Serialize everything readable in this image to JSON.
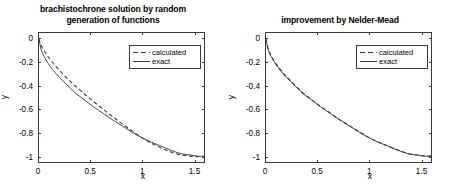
{
  "figure": {
    "width": 453,
    "height": 189,
    "background": "#ffffff",
    "line_color": "#3a3a3a",
    "axis_color": "#3a3a3a"
  },
  "panels": [
    {
      "id": "left",
      "title_line1": "brachistochrone solution by random",
      "title_line2": "generation of functions",
      "xlabel": "x",
      "ylabel": "y",
      "xticks": [
        "0",
        "0.5",
        "1",
        "1.5"
      ],
      "yticks": [
        "0",
        "-0.2",
        "-0.4",
        "-0.6",
        "-0.8",
        "-1"
      ],
      "legend": [
        {
          "label": "calculated",
          "style": "dashed"
        },
        {
          "label": "exact",
          "style": "solid"
        }
      ]
    },
    {
      "id": "right",
      "title_line1": "improvement by Nelder-Mead",
      "title_line2": "",
      "xlabel": "x",
      "ylabel": "y",
      "xticks": [
        "0",
        "0.5",
        "1",
        "1.5"
      ],
      "yticks": [
        "0",
        "-0.2",
        "-0.4",
        "-0.6",
        "-0.8",
        "-1"
      ],
      "legend": [
        {
          "label": "calculated",
          "style": "dashed"
        },
        {
          "label": "exact",
          "style": "solid"
        }
      ]
    }
  ],
  "chart_data": [
    {
      "type": "line",
      "title": "brachistochrone solution by random generation of functions",
      "xlabel": "x",
      "ylabel": "y",
      "xlim": [
        0,
        1.6
      ],
      "ylim": [
        -1.05,
        0.05
      ],
      "xticks": [
        0,
        0.5,
        1,
        1.5
      ],
      "yticks": [
        0,
        -0.2,
        -0.4,
        -0.6,
        -0.8,
        -1
      ],
      "grid": false,
      "legend_position": "upper right",
      "series": [
        {
          "name": "exact",
          "style": "solid",
          "x": [
            0,
            0.02,
            0.05,
            0.09,
            0.14,
            0.2,
            0.27,
            0.35,
            0.44,
            0.53,
            0.63,
            0.73,
            0.84,
            0.95,
            1.06,
            1.17,
            1.28,
            1.38,
            1.47,
            1.54,
            1.6
          ],
          "y": [
            0,
            -0.09,
            -0.15,
            -0.21,
            -0.27,
            -0.33,
            -0.39,
            -0.46,
            -0.52,
            -0.58,
            -0.64,
            -0.7,
            -0.76,
            -0.82,
            -0.87,
            -0.91,
            -0.95,
            -0.98,
            -0.99,
            -1.0,
            -1.0
          ]
        },
        {
          "name": "calculated",
          "style": "dashed",
          "x": [
            0,
            0.02,
            0.05,
            0.09,
            0.14,
            0.2,
            0.27,
            0.35,
            0.44,
            0.53,
            0.63,
            0.73,
            0.84,
            0.95,
            1.06,
            1.17,
            1.28,
            1.38,
            1.47,
            1.54,
            1.6
          ],
          "y": [
            0,
            -0.055,
            -0.1,
            -0.155,
            -0.21,
            -0.27,
            -0.335,
            -0.4,
            -0.47,
            -0.535,
            -0.605,
            -0.675,
            -0.745,
            -0.815,
            -0.875,
            -0.925,
            -0.965,
            -0.99,
            -1.0,
            -1.005,
            -1.005
          ]
        }
      ]
    },
    {
      "type": "line",
      "title": "improvement by Nelder-Mead",
      "xlabel": "x",
      "ylabel": "y",
      "xlim": [
        0,
        1.6
      ],
      "ylim": [
        -1.05,
        0.05
      ],
      "xticks": [
        0,
        0.5,
        1,
        1.5
      ],
      "yticks": [
        0,
        -0.2,
        -0.4,
        -0.6,
        -0.8,
        -1
      ],
      "grid": false,
      "legend_position": "upper right",
      "series": [
        {
          "name": "exact",
          "style": "solid",
          "x": [
            0,
            0.02,
            0.05,
            0.09,
            0.14,
            0.2,
            0.27,
            0.35,
            0.44,
            0.53,
            0.63,
            0.73,
            0.84,
            0.95,
            1.06,
            1.17,
            1.28,
            1.38,
            1.47,
            1.54,
            1.6
          ],
          "y": [
            0,
            -0.09,
            -0.15,
            -0.21,
            -0.27,
            -0.33,
            -0.39,
            -0.46,
            -0.52,
            -0.58,
            -0.64,
            -0.7,
            -0.76,
            -0.82,
            -0.87,
            -0.91,
            -0.95,
            -0.98,
            -0.99,
            -1.0,
            -1.0
          ]
        },
        {
          "name": "calculated",
          "style": "dashed",
          "x": [
            0,
            0.02,
            0.05,
            0.09,
            0.14,
            0.2,
            0.27,
            0.35,
            0.44,
            0.53,
            0.63,
            0.73,
            0.84,
            0.95,
            1.06,
            1.17,
            1.28,
            1.38,
            1.47,
            1.54,
            1.6
          ],
          "y": [
            0,
            -0.082,
            -0.143,
            -0.203,
            -0.263,
            -0.323,
            -0.385,
            -0.455,
            -0.517,
            -0.577,
            -0.637,
            -0.697,
            -0.757,
            -0.817,
            -0.868,
            -0.908,
            -0.948,
            -0.978,
            -0.992,
            -1.0,
            -1.0
          ]
        }
      ]
    }
  ]
}
